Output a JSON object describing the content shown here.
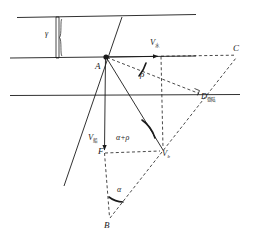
{
  "figure": {
    "type": "geometry-diagram",
    "domain": "vector navigation / river crossing diagram",
    "background_color": "#ffffff",
    "stroke_color": "#1a1a1a",
    "width": 253,
    "height": 241
  },
  "labels": {
    "point_a": "A",
    "point_b": "B",
    "point_c": "C",
    "point_f": "F",
    "point_d_base": "D",
    "point_d_sub": "登陆",
    "point_vb_base": "V",
    "point_vb_sub": "b",
    "v_ship_top_base": "V",
    "v_ship_top_sub": "水",
    "v_ship_left_base": "V",
    "v_ship_left_sub": "船",
    "angle_gamma": "γ",
    "angle_rho": "ρ",
    "angle_alpha": "α",
    "angle_alpha_plus_rho": "α+ρ"
  },
  "geometry": {
    "horizontal_lines": [
      {
        "name": "bank-line-top",
        "x1": 17,
        "y1": 17,
        "x2": 196,
        "y2": 14
      },
      {
        "name": "bank-line-middle",
        "x1": 10,
        "y1": 58,
        "x2": 196,
        "y2": 56
      },
      {
        "name": "bank-line-lower",
        "x1": 10,
        "y1": 95,
        "x2": 240,
        "y2": 94
      }
    ],
    "brace": {
      "name": "gamma-brace",
      "x": 58,
      "y_top": 17,
      "y_bottom": 58
    },
    "points": {
      "A": {
        "x": 106,
        "y": 57
      },
      "B": {
        "x": 110,
        "y": 221
      },
      "C": {
        "x": 238,
        "y": 56
      },
      "D": {
        "x": 201,
        "y": 95
      },
      "F": {
        "x": 104,
        "y": 153
      },
      "Vb": {
        "x": 163,
        "y": 150
      }
    },
    "solid_segments": [
      {
        "name": "segment-a-to-f",
        "from": "A",
        "to": "F"
      },
      {
        "name": "segment-a-to-vb",
        "from": "A",
        "to": "Vb"
      },
      {
        "name": "segment-a-downleft",
        "x1": 106,
        "y1": 57,
        "x2": 64,
        "y2": 184
      },
      {
        "name": "segment-a-upright",
        "x1": 106,
        "y1": 57,
        "x2": 121,
        "y2": 18
      },
      {
        "name": "segment-a-arrow-horizontal",
        "x1": 106,
        "y1": 57,
        "x2": 161,
        "y2": 56
      }
    ],
    "dashed_segments": [
      {
        "name": "dashed-a-to-c",
        "from": "A",
        "to": "C"
      },
      {
        "name": "dashed-a-to-d",
        "from": "A",
        "to": "D"
      },
      {
        "name": "dashed-vertical-vb",
        "x1": 161,
        "y1": 56,
        "x2": 163,
        "y2": 150
      },
      {
        "name": "dashed-f-to-vb",
        "from": "F",
        "to": "Vb"
      },
      {
        "name": "dashed-f-to-b",
        "from": "F",
        "to": "B"
      },
      {
        "name": "dashed-b-to-c",
        "from": "B",
        "to": "C"
      },
      {
        "name": "dashed-vb-to-c",
        "from": "Vb",
        "to": "C"
      }
    ],
    "angle_arcs": [
      {
        "name": "arc-rho",
        "at": "A",
        "label": "ρ"
      },
      {
        "name": "arc-alpha-plus-rho",
        "at": "Vb",
        "label": "α+ρ"
      },
      {
        "name": "arc-alpha",
        "at": "B",
        "label": "α"
      }
    ],
    "right_angle_marker": {
      "name": "right-angle-at-d",
      "x": 196,
      "y": 90
    },
    "arrowheads": [
      {
        "name": "arrowhead-v-water",
        "x": 161,
        "y": 56,
        "direction": "right"
      },
      {
        "name": "arrowhead-v-ship",
        "x": 104,
        "y": 147,
        "direction": "down"
      }
    ]
  }
}
